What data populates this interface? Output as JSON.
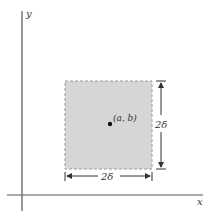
{
  "axes": {
    "x_label": "x",
    "y_label": "y"
  },
  "square": {
    "fill": "#d6d6d6",
    "border": "#9a9a9a",
    "border_style": "dashed"
  },
  "point": {
    "label": "(a, b)"
  },
  "dimensions": {
    "width_label": "2δ",
    "height_label": "2δ"
  },
  "colors": {
    "axis": "#555555",
    "arrow": "#333333"
  }
}
